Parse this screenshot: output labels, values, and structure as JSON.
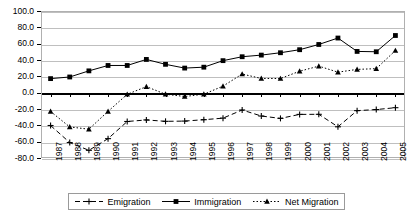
{
  "chart_data": {
    "type": "line",
    "title": "",
    "subtitle": "",
    "xlabel": "",
    "ylabel": "",
    "ylim": [
      -80,
      100
    ],
    "yticks": [
      "100.0",
      "80.0",
      "60.0",
      "40.0",
      "20.0",
      "0.0",
      "-20.0",
      "-40.0",
      "-60.0",
      "-80.0"
    ],
    "ytick_values": [
      100,
      80,
      60,
      40,
      20,
      0,
      -20,
      -40,
      -60,
      -80
    ],
    "grid": true,
    "legend_position": "bottom",
    "categories": [
      "1987",
      "1988",
      "1989",
      "1990",
      "1991",
      "1992",
      "1993",
      "1994",
      "1995",
      "1996",
      "1997",
      "1998",
      "1999",
      "2000",
      "2001",
      "2002",
      "2003",
      "2004",
      "2005"
    ],
    "series": [
      {
        "name": "Emigration",
        "marker": "cross",
        "line_style": "dashed",
        "color": "#000000",
        "values": [
          -40.2,
          -61.1,
          -70.6,
          -56.3,
          -35.3,
          -33.4,
          -35.1,
          -34.8,
          -33.1,
          -31.2,
          -21.2,
          -28.6,
          -31.5,
          -26.6,
          -26.5,
          -41.8,
          -22.0,
          -20.7,
          -18.4
        ]
      },
      {
        "name": "Immigration",
        "marker": "square",
        "line_style": "solid",
        "color": "#000000",
        "values": [
          17.2,
          19.2,
          26.7,
          33.3,
          33.3,
          40.7,
          34.7,
          30.1,
          31.2,
          39.2,
          44.0,
          46.0,
          48.9,
          52.6,
          59.0,
          66.9,
          50.5,
          50.1,
          70.0
        ]
      },
      {
        "name": "Net Migration",
        "marker": "triangle",
        "line_style": "dotted",
        "color": "#000000",
        "values": [
          -23.0,
          -42.0,
          -44.7,
          -22.9,
          -2.0,
          7.4,
          -1.9,
          -4.7,
          -1.9,
          8.0,
          22.8,
          17.4,
          17.3,
          26.3,
          32.5,
          25.1,
          28.5,
          29.4,
          51.6
        ]
      }
    ]
  },
  "legend": {
    "entries": [
      {
        "label": "Emigration"
      },
      {
        "label": "Immigration"
      },
      {
        "label": "Net Migration"
      }
    ]
  }
}
